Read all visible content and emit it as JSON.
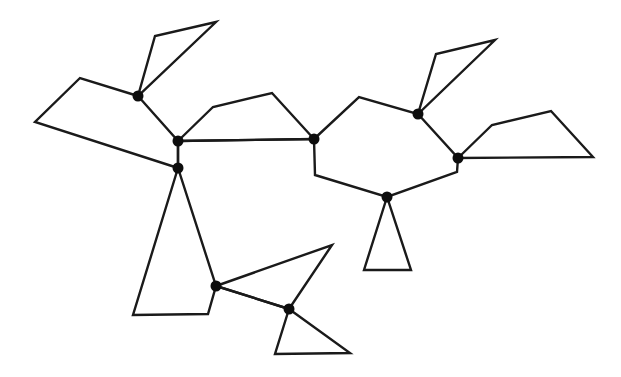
{
  "diagram": {
    "type": "graph-of-polygons",
    "width": 621,
    "height": 377,
    "colors": {
      "background": "#ffffff",
      "stroke": "#1a1a1a",
      "node": "#0d0d0d"
    },
    "stroke_width": 2.4,
    "node_radius": 5.5,
    "nodes": [
      {
        "id": "A",
        "x": 138,
        "y": 96
      },
      {
        "id": "B",
        "x": 178,
        "y": 141
      },
      {
        "id": "C",
        "x": 178,
        "y": 168
      },
      {
        "id": "D",
        "x": 314,
        "y": 139
      },
      {
        "id": "E",
        "x": 418,
        "y": 114
      },
      {
        "id": "F",
        "x": 458,
        "y": 158
      },
      {
        "id": "G",
        "x": 387,
        "y": 197
      },
      {
        "id": "H",
        "x": 216,
        "y": 286
      },
      {
        "id": "I",
        "x": 289,
        "y": 309
      }
    ],
    "polygons": [
      {
        "name": "left-quad",
        "points": [
          [
            138,
            96
          ],
          [
            80,
            78
          ],
          [
            35,
            122
          ],
          [
            178,
            168
          ],
          [
            178,
            141
          ]
        ]
      },
      {
        "name": "top-left-kite",
        "points": [
          [
            138,
            96
          ],
          [
            155,
            36
          ],
          [
            216,
            22
          ]
        ]
      },
      {
        "name": "middle-pentagon",
        "points": [
          [
            178,
            141
          ],
          [
            213,
            107
          ],
          [
            272,
            93
          ],
          [
            314,
            139
          ]
        ]
      },
      {
        "name": "right-hexagon",
        "points": [
          [
            314,
            139
          ],
          [
            359,
            97
          ],
          [
            418,
            114
          ],
          [
            458,
            158
          ],
          [
            457,
            172
          ],
          [
            387,
            197
          ],
          [
            315,
            175
          ]
        ]
      },
      {
        "name": "top-right-kite",
        "points": [
          [
            418,
            114
          ],
          [
            436,
            54
          ],
          [
            495,
            40
          ]
        ]
      },
      {
        "name": "right-quad",
        "points": [
          [
            458,
            158
          ],
          [
            492,
            125
          ],
          [
            551,
            111
          ],
          [
            593,
            157
          ]
        ]
      },
      {
        "name": "bottom-right-triangle",
        "points": [
          [
            387,
            197
          ],
          [
            364,
            270
          ],
          [
            411,
            270
          ]
        ]
      },
      {
        "name": "bottom-left-quad",
        "points": [
          [
            178,
            168
          ],
          [
            133,
            315
          ],
          [
            208,
            314
          ],
          [
            216,
            286
          ]
        ]
      },
      {
        "name": "bottom-middle-triangle",
        "points": [
          [
            216,
            286
          ],
          [
            332,
            245
          ],
          [
            289,
            309
          ]
        ]
      },
      {
        "name": "bottom-triangle",
        "points": [
          [
            289,
            309
          ],
          [
            275,
            354
          ],
          [
            350,
            353
          ]
        ]
      }
    ],
    "open_edges": [
      {
        "name": "edge-B-D",
        "points": [
          [
            178,
            141
          ],
          [
            314,
            139
          ]
        ]
      },
      {
        "name": "edge-B-C",
        "points": [
          [
            178,
            141
          ],
          [
            178,
            168
          ]
        ]
      },
      {
        "name": "edge-H-I",
        "points": [
          [
            216,
            286
          ],
          [
            289,
            309
          ]
        ]
      }
    ]
  }
}
